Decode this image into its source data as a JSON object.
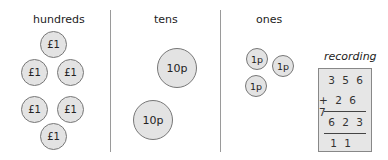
{
  "columns": [
    {
      "heading": "hundreds",
      "coin_label": "£1",
      "coin_count": 6
    },
    {
      "heading": "tens",
      "coin_label": "10p",
      "coin_count": 2
    },
    {
      "heading": "ones",
      "coin_label": "1p",
      "coin_count": 3
    }
  ],
  "coins": {
    "hundreds": [
      "£1",
      "£1",
      "£1",
      "£1",
      "£1",
      "£1"
    ],
    "tens": [
      "10p",
      "10p"
    ],
    "ones": [
      "1p",
      "1p",
      "1p"
    ]
  },
  "recording": {
    "title": "recording",
    "addend1": "3 5 6",
    "addend2": "+ 2 6 7",
    "sum": "6 2 3",
    "carries": "1 1"
  },
  "colors": {
    "coin_fill": "#e3e3e3",
    "box_fill": "#e6e6e6",
    "divider": "#9a9a9a"
  }
}
